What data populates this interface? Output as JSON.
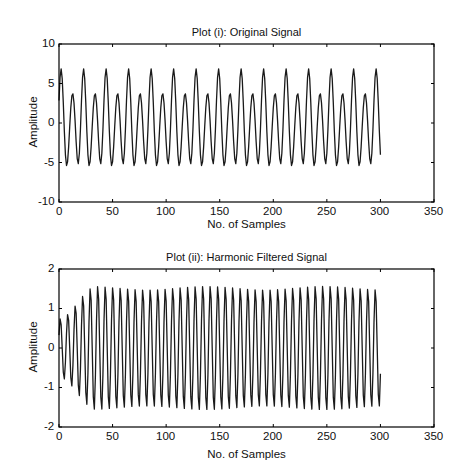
{
  "chart_data": [
    {
      "type": "line",
      "title": "Plot (i): Original Signal",
      "xlabel": "No. of Samples",
      "ylabel": "Amplitude",
      "xlim": [
        0,
        350
      ],
      "ylim": [
        -10,
        10
      ],
      "xticks": [
        0,
        50,
        100,
        150,
        200,
        250,
        300,
        350
      ],
      "yticks": [
        -10,
        -5,
        0,
        5,
        10
      ],
      "grid": false,
      "legend": null,
      "series": [
        {
          "name": "Original Signal",
          "n_samples": 301,
          "model": "sum of sinusoids",
          "components": [
            {
              "amplitude": 5.3,
              "period_samples": 10.5,
              "phase": 0.35
            },
            {
              "amplitude": 1.1,
              "period_samples": 21.0,
              "phase": 1.2
            },
            {
              "amplitude": 0.5,
              "period_samples": 7.0,
              "phase": 0.0
            }
          ],
          "observed_peaks": [
            4.3,
            6.6
          ],
          "observed_troughs": [
            -4.3,
            -6.7
          ],
          "end_value": 2.5
        }
      ]
    },
    {
      "type": "line",
      "title": "Plot (ii): Harmonic Filtered Signal",
      "xlabel": "No. of Samples",
      "ylabel": "Amplitude",
      "xlim": [
        0,
        350
      ],
      "ylim": [
        -2,
        2
      ],
      "xticks": [
        0,
        50,
        100,
        150,
        200,
        250,
        300,
        350
      ],
      "yticks": [
        -2,
        -1,
        0,
        1,
        2
      ],
      "grid": false,
      "legend": null,
      "series": [
        {
          "name": "Harmonic Filtered Signal",
          "n_samples": 301,
          "model": "sinusoid with transient start-up",
          "period_samples": 7.0,
          "steady_amplitude": 1.55,
          "initial_amplitude": 0.75,
          "settle_sample": 35,
          "start_value": 0.6,
          "end_value": 1.4
        }
      ]
    }
  ],
  "plots": [
    {
      "title": "Plot (i): Original Signal",
      "xlabel": "No. of Samples",
      "ylabel": "Amplitude",
      "xtick_labels": [
        "0",
        "50",
        "100",
        "150",
        "200",
        "250",
        "300",
        "350"
      ],
      "ytick_labels": [
        "10",
        "5",
        "0",
        "-5",
        "-10"
      ]
    },
    {
      "title": "Plot (ii): Harmonic Filtered Signal",
      "xlabel": "No. of Samples",
      "ylabel": "Amplitude",
      "xtick_labels": [
        "0",
        "50",
        "100",
        "150",
        "200",
        "250",
        "300",
        "350"
      ],
      "ytick_labels": [
        "2",
        "1",
        "0",
        "-1",
        "-2"
      ]
    }
  ],
  "colors": {
    "line": "#1a1a1a",
    "axes": "#000000",
    "background": "#ffffff"
  }
}
